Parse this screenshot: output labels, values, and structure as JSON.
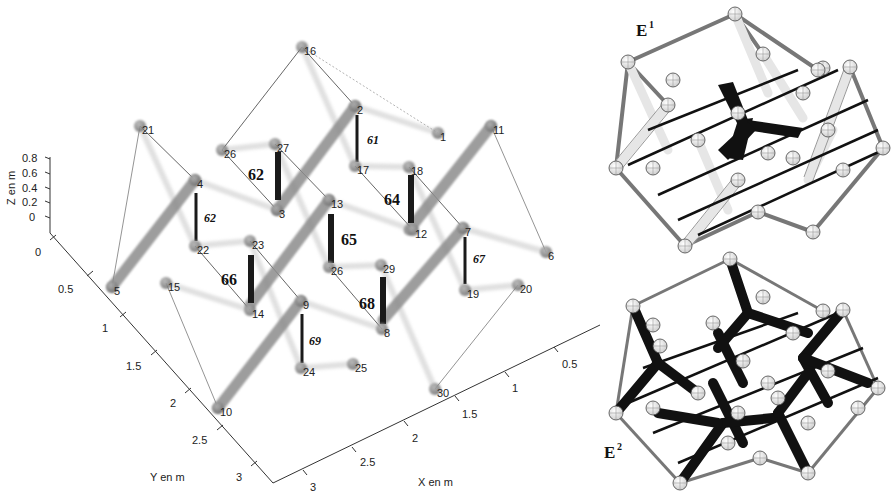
{
  "figure": {
    "left_plot": {
      "axes": {
        "z": {
          "title": "Z en m",
          "ticks": [
            "0.8",
            "0.6",
            "0.4",
            "0.2",
            "0"
          ]
        },
        "y": {
          "title": "Y en m",
          "ticks": [
            "0",
            "0.5",
            "1",
            "1.5",
            "2",
            "2.5",
            "3"
          ]
        },
        "x": {
          "title": "X en m",
          "ticks": [
            "0.5",
            "1",
            "1.5",
            "2",
            "2.5",
            "3"
          ]
        }
      },
      "nodes": [
        {
          "id": "16",
          "x": 302,
          "y": 47
        },
        {
          "id": "21",
          "x": 140,
          "y": 126
        },
        {
          "id": "2",
          "x": 355,
          "y": 106
        },
        {
          "id": "1",
          "x": 438,
          "y": 133
        },
        {
          "id": "11",
          "x": 491,
          "y": 126
        },
        {
          "id": "26a",
          "label": "26",
          "x": 222,
          "y": 150
        },
        {
          "id": "27",
          "x": 275,
          "y": 144
        },
        {
          "id": "17",
          "x": 355,
          "y": 166
        },
        {
          "id": "18",
          "x": 409,
          "y": 167
        },
        {
          "id": "4",
          "x": 195,
          "y": 180
        },
        {
          "id": "3",
          "x": 277,
          "y": 210
        },
        {
          "id": "13",
          "x": 329,
          "y": 200
        },
        {
          "id": "12",
          "x": 413,
          "y": 230
        },
        {
          "id": "7",
          "x": 463,
          "y": 228
        },
        {
          "id": "6",
          "x": 546,
          "y": 252
        },
        {
          "id": "22",
          "x": 195,
          "y": 246
        },
        {
          "id": "23",
          "x": 250,
          "y": 241
        },
        {
          "id": "26b",
          "label": "26",
          "x": 329,
          "y": 267
        },
        {
          "id": "29",
          "x": 381,
          "y": 265
        },
        {
          "id": "19",
          "x": 465,
          "y": 290
        },
        {
          "id": "20",
          "x": 518,
          "y": 285
        },
        {
          "id": "5",
          "x": 112,
          "y": 287
        },
        {
          "id": "15",
          "x": 166,
          "y": 283
        },
        {
          "id": "14",
          "x": 250,
          "y": 310
        },
        {
          "id": "9",
          "x": 301,
          "y": 301
        },
        {
          "id": "8",
          "x": 382,
          "y": 329
        },
        {
          "id": "24",
          "x": 301,
          "y": 368
        },
        {
          "id": "25",
          "x": 353,
          "y": 364
        },
        {
          "id": "10",
          "x": 218,
          "y": 408
        },
        {
          "id": "30",
          "x": 435,
          "y": 389
        }
      ],
      "bars": [
        {
          "label": "62",
          "style": "bold",
          "x1": 278,
          "y1": 152,
          "x2": 278,
          "y2": 200,
          "lx": 248,
          "ly": 180
        },
        {
          "label": "61",
          "style": "italic",
          "x1": 357,
          "y1": 115,
          "x2": 357,
          "y2": 162,
          "lx": 367,
          "ly": 144
        },
        {
          "label": "64",
          "style": "bold",
          "x1": 411,
          "y1": 175,
          "x2": 411,
          "y2": 223,
          "lx": 384,
          "ly": 205
        },
        {
          "label": "62",
          "style": "italic",
          "x1": 196,
          "y1": 193,
          "x2": 196,
          "y2": 241,
          "lx": 204,
          "ly": 222
        },
        {
          "label": "65",
          "style": "bold",
          "x1": 331,
          "y1": 214,
          "x2": 331,
          "y2": 263,
          "lx": 341,
          "ly": 245
        },
        {
          "label": "67",
          "style": "italic",
          "x1": 465,
          "y1": 237,
          "x2": 465,
          "y2": 284,
          "lx": 473,
          "ly": 263
        },
        {
          "label": "66",
          "style": "bold",
          "x1": 251,
          "y1": 255,
          "x2": 251,
          "y2": 303,
          "lx": 221,
          "ly": 285
        },
        {
          "label": "68",
          "style": "bold",
          "x1": 383,
          "y1": 277,
          "x2": 383,
          "y2": 324,
          "lx": 359,
          "ly": 309
        },
        {
          "label": "69",
          "style": "italic",
          "x1": 302,
          "y1": 314,
          "x2": 302,
          "y2": 363,
          "lx": 309,
          "ly": 345
        }
      ]
    },
    "panels": [
      {
        "title": "E",
        "sup": "1",
        "x": 637,
        "y": 32
      },
      {
        "title": "E",
        "sup": "2",
        "x": 604,
        "y": 452
      }
    ],
    "colors": {
      "node": "#8a8a8a",
      "thick_member": "#9a9a9a",
      "bar": "#1a1a1a",
      "thin_line": "#555555",
      "axis": "#333333"
    }
  }
}
